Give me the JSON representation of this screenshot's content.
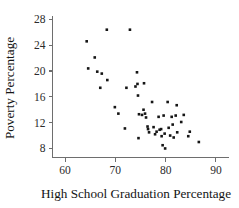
{
  "chart_data": {
    "type": "scatter",
    "title": "",
    "xlabel": "High School Graduation Percentage",
    "ylabel": "Poverty Percentage",
    "xlim": [
      57.5,
      92.5
    ],
    "ylim": [
      6.6,
      28.6
    ],
    "xticks": [
      60,
      70,
      80,
      90
    ],
    "yticks": [
      8,
      12,
      16,
      20,
      24,
      28
    ],
    "xtick_labels": [
      "60",
      "70",
      "80",
      "90"
    ],
    "ytick_labels": [
      "8",
      "12",
      "16",
      "20",
      "24",
      "28"
    ],
    "grid": false,
    "legend": null,
    "marker": "filled-square",
    "marker_color": "#151515",
    "n_points": 51,
    "points": [
      [
        64.3,
        24.6
      ],
      [
        64.6,
        20.4
      ],
      [
        65.9,
        22.1
      ],
      [
        66.4,
        19.9
      ],
      [
        67.3,
        19.6
      ],
      [
        67.0,
        17.4
      ],
      [
        68.3,
        26.4
      ],
      [
        68.4,
        18.6
      ],
      [
        69.9,
        14.4
      ],
      [
        70.6,
        13.4
      ],
      [
        71.9,
        11.1
      ],
      [
        72.2,
        17.4
      ],
      [
        72.9,
        26.4
      ],
      [
        74.3,
        19.8
      ],
      [
        74.0,
        17.6
      ],
      [
        74.4,
        18.0
      ],
      [
        74.5,
        16.2
      ],
      [
        74.7,
        13.3
      ],
      [
        74.6,
        9.6
      ],
      [
        75.3,
        13.2
      ],
      [
        75.7,
        18.1
      ],
      [
        75.6,
        14.0
      ],
      [
        75.9,
        13.4
      ],
      [
        76.1,
        12.8
      ],
      [
        76.4,
        11.4
      ],
      [
        76.5,
        11.0
      ],
      [
        76.7,
        10.5
      ],
      [
        77.3,
        15.2
      ],
      [
        77.6,
        11.3
      ],
      [
        77.9,
        10.2
      ],
      [
        78.2,
        10.6
      ],
      [
        78.6,
        12.9
      ],
      [
        78.8,
        10.9
      ],
      [
        79.1,
        11.0
      ],
      [
        79.2,
        9.9
      ],
      [
        79.4,
        8.5
      ],
      [
        79.6,
        13.1
      ],
      [
        79.8,
        10.3
      ],
      [
        79.9,
        8.0
      ],
      [
        80.4,
        15.2
      ],
      [
        80.6,
        11.2
      ],
      [
        80.9,
        10.0
      ],
      [
        81.2,
        12.9
      ],
      [
        81.4,
        11.7
      ],
      [
        81.6,
        9.7
      ],
      [
        82.0,
        13.1
      ],
      [
        82.2,
        14.7
      ],
      [
        82.3,
        10.5
      ],
      [
        83.1,
        12.1
      ],
      [
        83.6,
        13.2
      ],
      [
        84.5,
        9.9
      ],
      [
        84.8,
        10.6
      ],
      [
        86.6,
        9.0
      ]
    ]
  }
}
